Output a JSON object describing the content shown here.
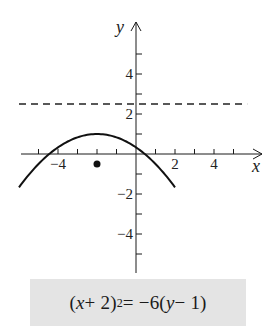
{
  "chart_data": {
    "type": "line",
    "title": "",
    "xlabel": "x",
    "ylabel": "y",
    "xlim": [
      -6,
      6.5
    ],
    "ylim": [
      -6,
      6.5
    ],
    "grid": false,
    "x_ticks": [
      -5,
      -4,
      -3,
      -2,
      -1,
      1,
      2,
      3,
      4,
      5
    ],
    "x_tick_labels": [
      {
        "value": -4,
        "text": "−4"
      },
      {
        "value": 2,
        "text": "2"
      },
      {
        "value": 4,
        "text": "4"
      }
    ],
    "y_ticks": [
      -5,
      -4,
      -3,
      -2,
      -1,
      1,
      2,
      3,
      4,
      5
    ],
    "y_tick_labels": [
      {
        "value": 4,
        "text": "4"
      },
      {
        "value": 2,
        "text": "2"
      },
      {
        "value": -2,
        "text": "−2"
      },
      {
        "value": -4,
        "text": "−4"
      }
    ],
    "series": [
      {
        "name": "parabola",
        "equation": "(x + 2)^2 = -6(y - 1)",
        "style": "solid",
        "vertex": [
          -2,
          1
        ],
        "x_range": [
          -6,
          2
        ],
        "x": [
          -6,
          -5,
          -4,
          -3,
          -2,
          -1,
          0,
          1,
          2
        ],
        "y": [
          -1.667,
          -0.5,
          0.333,
          0.833,
          1,
          0.833,
          0.333,
          -0.5,
          -1.667
        ]
      },
      {
        "name": "directrix",
        "equation": "y = 2.5",
        "style": "dashed",
        "x_range": [
          -6,
          5.7
        ],
        "y": 2.5
      }
    ],
    "points": [
      {
        "name": "focus",
        "x": -2,
        "y": -0.5
      }
    ],
    "annotations": [
      {
        "text": "(x + 2)² = −6(y − 1)",
        "position": "below-plot",
        "boxed": true
      }
    ]
  },
  "caption": {
    "lhs_open": "(",
    "lhs_var": "x",
    "lhs_rest": " + 2)",
    "lhs_exp": "2",
    "middle": " = −6(",
    "rhs_var": "y",
    "rhs_rest": " − 1)"
  },
  "axis_labels": {
    "x": "x",
    "y": "y"
  }
}
